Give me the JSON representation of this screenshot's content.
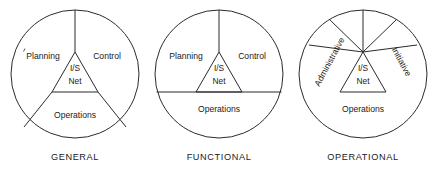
{
  "figure": {
    "background_color": "#ffffff",
    "line_color": "#2b2b2b",
    "text_color": "#1a1a1a"
  },
  "core": {
    "line1": "I/S",
    "line2": "Net"
  },
  "diagrams": [
    {
      "id": "general",
      "caption": "GENERAL",
      "center_x": 75,
      "center_y": 74,
      "radius": 64,
      "sectors": [
        {
          "name": "planning",
          "label": "Planning",
          "x": 43,
          "y": 57,
          "rotation": 0
        },
        {
          "name": "control",
          "label": "Control",
          "x": 107,
          "y": 57,
          "rotation": 0
        },
        {
          "name": "operations",
          "label": "Operations",
          "x": 75,
          "y": 116,
          "rotation": 0
        }
      ],
      "core_label": {
        "x": 75,
        "y": 74
      }
    },
    {
      "id": "functional",
      "caption": "FUNCTIONAL",
      "center_x": 219,
      "center_y": 74,
      "radius": 64,
      "sectors": [
        {
          "name": "planning",
          "label": "Planning",
          "x": 186,
          "y": 57,
          "rotation": 0
        },
        {
          "name": "control",
          "label": "Control",
          "x": 252,
          "y": 57,
          "rotation": 0
        },
        {
          "name": "operations",
          "label": "Operations",
          "x": 219,
          "y": 110,
          "rotation": 0
        }
      ],
      "core_label": {
        "x": 219,
        "y": 74
      }
    },
    {
      "id": "operational",
      "caption": "OPERATIONAL",
      "center_x": 363,
      "center_y": 74,
      "radius": 64,
      "sectors": [
        {
          "name": "administrative",
          "label": "Administrative",
          "x": 330,
          "y": 62,
          "rotation": -62
        },
        {
          "name": "initiative",
          "label": "Initiative",
          "x": 401,
          "y": 62,
          "rotation": 62
        },
        {
          "name": "operations",
          "label": "Operations",
          "x": 363,
          "y": 110,
          "rotation": 0
        }
      ],
      "core_label": {
        "x": 363,
        "y": 74
      }
    }
  ],
  "captions": {
    "y": 158
  }
}
